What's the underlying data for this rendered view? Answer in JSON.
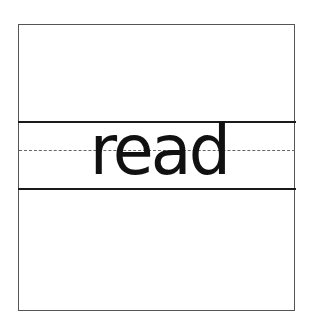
{
  "worksheet": {
    "word": "read",
    "guide_lines": [
      "top-line",
      "dashed-midline",
      "baseline"
    ]
  }
}
